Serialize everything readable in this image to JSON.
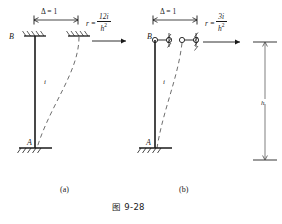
{
  "figure": {
    "number": "图 9-28",
    "panels": [
      {
        "key": "a",
        "caption": "(a)",
        "top_joint_label": "B",
        "base_joint_label": "A",
        "member_stiffness_label": "i",
        "displacement_label": "Δ = 1",
        "top_support_type": "fixed-sliding-hatched",
        "base_support_type": "fixed-hatched",
        "force_symbol": "r",
        "force_equals": "=",
        "force_numerator": "12i",
        "force_denominator_base": "h",
        "force_denominator_exp": "2",
        "force_expression": "r = 12i / h²"
      },
      {
        "key": "b",
        "caption": "(b)",
        "top_joint_label": "B",
        "base_joint_label": "A",
        "member_stiffness_label": "i",
        "displacement_label": "Δ = 1",
        "top_support_type": "hinge-roller-hatched",
        "base_support_type": "fixed-hatched",
        "force_symbol": "r",
        "force_equals": "=",
        "force_numerator": "3i",
        "force_denominator_base": "h",
        "force_denominator_exp": "2",
        "force_expression": "r = 3i / h²"
      }
    ],
    "right_element": {
      "dimension_label": "h",
      "description": "vertical member with height dimension line"
    }
  },
  "style": {
    "ink": "#1a1a1a",
    "paper": "#ffffff",
    "dashed": "#6e6e6e"
  }
}
